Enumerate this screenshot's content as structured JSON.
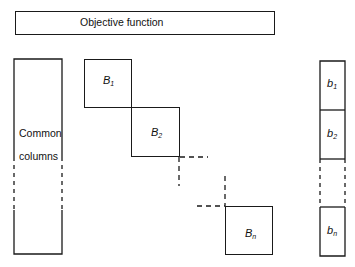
{
  "diagram": {
    "objective": {
      "label": "Objective function"
    },
    "common": {
      "line1": "Common",
      "line2": "columns"
    },
    "blocks": [
      {
        "base": "B",
        "sub": "1"
      },
      {
        "base": "B",
        "sub": "2"
      },
      {
        "base": "B",
        "sub": "n"
      }
    ],
    "rhs": [
      {
        "base": "b",
        "sub": "1"
      },
      {
        "base": "b",
        "sub": "2"
      },
      {
        "base": "b",
        "sub": "n"
      }
    ]
  }
}
